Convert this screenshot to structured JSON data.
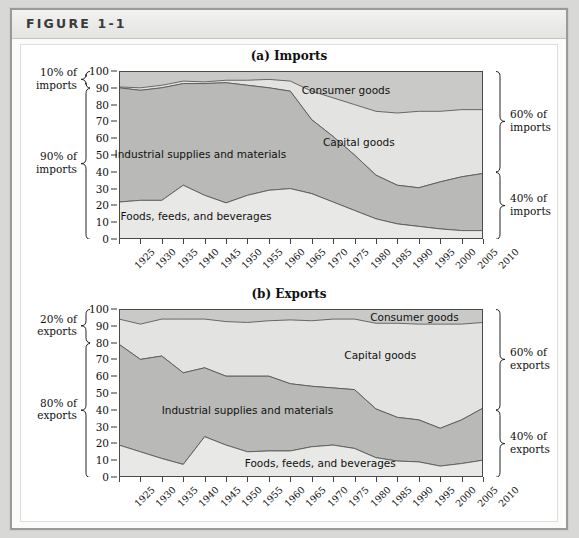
{
  "figure": {
    "label": "FIGURE 1-1"
  },
  "panels": [
    {
      "id": "imports",
      "title": "(a) Imports",
      "left_notes": [
        {
          "text_line1": "10% of",
          "text_line2": "imports",
          "from": 90,
          "to": 100
        },
        {
          "text_line1": "90% of",
          "text_line2": "imports",
          "from": 0,
          "to": 90
        }
      ],
      "right_notes": [
        {
          "text_line1": "60% of",
          "text_line2": "imports",
          "from": 40,
          "to": 100
        },
        {
          "text_line1": "40% of",
          "text_line2": "imports",
          "from": 0,
          "to": 40
        }
      ],
      "area_labels": [
        {
          "text": "Consumer goods",
          "x": 1978,
          "y": 88
        },
        {
          "text": "Capital goods",
          "x": 1981,
          "y": 57
        },
        {
          "text": "Industrial supplies and materials",
          "x": 1944,
          "y": 50
        },
        {
          "text": "Foods, feeds, and beverages",
          "x": 1943,
          "y": 13
        }
      ]
    },
    {
      "id": "exports",
      "title": "(b) Exports",
      "left_notes": [
        {
          "text_line1": "20% of",
          "text_line2": "exports",
          "from": 80,
          "to": 100
        },
        {
          "text_line1": "80% of",
          "text_line2": "exports",
          "from": 0,
          "to": 80
        }
      ],
      "right_notes": [
        {
          "text_line1": "60% of",
          "text_line2": "exports",
          "from": 40,
          "to": 100
        },
        {
          "text_line1": "40% of",
          "text_line2": "exports",
          "from": 0,
          "to": 40
        }
      ],
      "area_labels": [
        {
          "text": "Consumer goods",
          "x": 1994,
          "y": 94.5
        },
        {
          "text": "Capital goods",
          "x": 1986,
          "y": 72
        },
        {
          "text": "Industrial supplies and materials",
          "x": 1955,
          "y": 39
        },
        {
          "text": "Foods, feeds, and beverages",
          "x": 1972,
          "y": 8
        }
      ]
    }
  ],
  "chart_data": [
    {
      "type": "area",
      "title": "(a) Imports",
      "xlabel": "",
      "ylabel": "",
      "ylim": [
        0,
        100
      ],
      "xlim": [
        1925,
        2010
      ],
      "grid": false,
      "legend": "inline-area-labels",
      "stacked": true,
      "categories": [
        1925,
        1930,
        1935,
        1940,
        1945,
        1950,
        1955,
        1960,
        1965,
        1970,
        1975,
        1980,
        1985,
        1990,
        1995,
        2000,
        2005,
        2010
      ],
      "tick_labels_y": [
        0,
        10,
        20,
        30,
        40,
        50,
        60,
        70,
        80,
        90,
        100
      ],
      "series": [
        {
          "name": "Foods, feeds, and beverages",
          "color": "#e8e8e6",
          "values": [
            22,
            23,
            23,
            32,
            26,
            21.5,
            26,
            29,
            30,
            27,
            22,
            17,
            12,
            9,
            7.5,
            6,
            5,
            5
          ]
        },
        {
          "name": "Industrial supplies and materials",
          "color": "#b9b9b7",
          "values": [
            68,
            65.5,
            67,
            60.5,
            66.5,
            71.5,
            65.5,
            61,
            58,
            44,
            39,
            33,
            26,
            23,
            23,
            28,
            32,
            34
          ]
        },
        {
          "name": "Capital goods",
          "color": "#e3e3e1",
          "values": [
            0.5,
            1.5,
            1.5,
            1.5,
            1,
            1.5,
            3,
            5,
            6,
            17,
            23,
            30,
            38,
            43,
            45.5,
            42,
            40,
            38
          ]
        },
        {
          "name": "Consumer goods",
          "color": "#c9c9c7",
          "values": [
            9.5,
            10,
            8.5,
            6,
            6.5,
            5.5,
            5.5,
            5,
            6,
            12,
            16,
            20,
            24,
            25,
            24,
            24,
            23,
            23
          ]
        }
      ],
      "cumulative_boundaries": {
        "food_top": [
          22,
          23,
          23,
          32,
          26,
          21.5,
          26,
          29,
          30,
          27,
          22,
          17,
          12,
          9,
          7.5,
          6,
          5,
          5
        ],
        "industrial_top": [
          90,
          88.5,
          90,
          92.5,
          92.5,
          93,
          91.5,
          90,
          88,
          71,
          61,
          50,
          38,
          32,
          30.5,
          34,
          37,
          39
        ],
        "capital_top": [
          90.5,
          90,
          91.5,
          94,
          93.5,
          94.5,
          94.5,
          95,
          94,
          88,
          84,
          80,
          76,
          75,
          76,
          76,
          77,
          77
        ]
      }
    },
    {
      "type": "area",
      "title": "(b) Exports",
      "xlabel": "",
      "ylabel": "",
      "ylim": [
        0,
        100
      ],
      "xlim": [
        1925,
        2010
      ],
      "grid": false,
      "legend": "inline-area-labels",
      "stacked": true,
      "categories": [
        1925,
        1930,
        1935,
        1940,
        1945,
        1950,
        1955,
        1960,
        1965,
        1970,
        1975,
        1980,
        1985,
        1990,
        1995,
        2000,
        2005,
        2010
      ],
      "tick_labels_y": [
        0,
        10,
        20,
        30,
        40,
        50,
        60,
        70,
        80,
        90,
        100
      ],
      "series": [
        {
          "name": "Foods, feeds, and beverages",
          "color": "#e8e8e6",
          "values": [
            19,
            15,
            11,
            7.5,
            24,
            19,
            15,
            15.5,
            15.5,
            18,
            19,
            17,
            11.5,
            9.5,
            9,
            6.5,
            8,
            10
          ]
        },
        {
          "name": "Industrial supplies and materials",
          "color": "#b9b9b7",
          "values": [
            60,
            55,
            61,
            54.5,
            41,
            41,
            45,
            44.5,
            40,
            36,
            34,
            35,
            29,
            26,
            25,
            22.5,
            26,
            31
          ]
        },
        {
          "name": "Capital goods",
          "color": "#e3e3e1",
          "values": [
            15,
            21,
            22,
            32,
            29,
            32.5,
            32,
            33,
            38,
            39,
            41,
            42,
            51,
            56,
            57,
            62,
            57,
            51
          ]
        },
        {
          "name": "Consumer goods",
          "color": "#c9c9c7",
          "values": [
            6,
            9,
            6,
            6,
            6,
            7.5,
            8,
            7,
            6.5,
            7,
            6,
            6,
            8.5,
            8.5,
            9,
            9,
            9,
            8
          ]
        }
      ],
      "cumulative_boundaries": {
        "food_top": [
          19,
          15,
          11,
          7.5,
          24,
          19,
          15,
          15.5,
          15.5,
          18,
          19,
          17,
          11.5,
          9.5,
          9,
          6.5,
          8,
          10
        ],
        "industrial_top": [
          79,
          70,
          72,
          62,
          65,
          60,
          60,
          60,
          55.5,
          54,
          53,
          52,
          40.5,
          35.5,
          34,
          29,
          34,
          41
        ],
        "capital_top": [
          94,
          91,
          94,
          94,
          94,
          92.5,
          92,
          93,
          93.5,
          93,
          94,
          94,
          91.5,
          91.5,
          91,
          91,
          91,
          92
        ]
      }
    }
  ]
}
